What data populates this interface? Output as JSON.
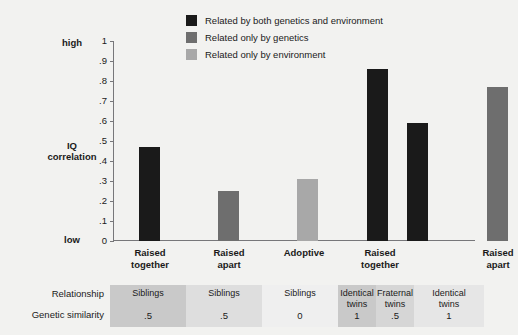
{
  "chart_data": {
    "type": "bar",
    "title": "",
    "xlabel": "",
    "ylabel": "IQ correlation",
    "ylim": [
      0,
      1
    ],
    "grid": false,
    "legend_position": "top-right",
    "categories": [
      "Raised\ntogether",
      "Raised\napart",
      "Adoptive",
      "Raised\ntogether",
      "",
      "Raised\napart"
    ],
    "bars": [
      {
        "label": "Raised together",
        "value": 0.47,
        "group": "both"
      },
      {
        "label": "Raised apart",
        "value": 0.25,
        "group": "genetics"
      },
      {
        "label": "Adoptive",
        "value": 0.31,
        "group": "environment"
      },
      {
        "label": "Raised together",
        "value": 0.86,
        "group": "both"
      },
      {
        "label": "Raised together",
        "value": 0.59,
        "group": "both"
      },
      {
        "label": "Raised apart",
        "value": 0.77,
        "group": "genetics"
      }
    ],
    "values": [
      0.47,
      0.25,
      0.31,
      0.86,
      0.59,
      0.77
    ],
    "yticks": [
      "0",
      ".1",
      ".2",
      ".3",
      ".4",
      ".5",
      ".6",
      ".7",
      ".8",
      ".9",
      "1"
    ],
    "ytick_values": [
      0,
      0.1,
      0.2,
      0.3,
      0.4,
      0.5,
      0.6,
      0.7,
      0.8,
      0.9,
      1
    ],
    "axis_high_label": "high",
    "axis_low_label": "low",
    "axis_title_line1": "IQ",
    "axis_title_line2": "correlation",
    "series": [
      {
        "name": "Related by both genetics and environment",
        "color": "#1a1a1a"
      },
      {
        "name": "Related only by genetics",
        "color": "#6e6e6e"
      },
      {
        "name": "Related only by environment",
        "color": "#a8a8a8"
      }
    ]
  },
  "legend": {
    "items": [
      {
        "label": "Related by both genetics and environment",
        "color": "#1a1a1a"
      },
      {
        "label": "Related only by genetics",
        "color": "#6e6e6e"
      },
      {
        "label": "Related only by environment",
        "color": "#a8a8a8"
      }
    ]
  },
  "categories": [
    {
      "line1": "Raised",
      "line2": "together"
    },
    {
      "line1": "Raised",
      "line2": "apart"
    },
    {
      "line1": "Adoptive",
      "line2": ""
    },
    {
      "line1": "Raised",
      "line2": "together"
    },
    {
      "line1": "Raised",
      "line2": "apart"
    }
  ],
  "table": {
    "row_headers": [
      "Relationship",
      "Genetic similarity"
    ],
    "cells": [
      {
        "relationship": "Siblings",
        "genetic_similarity": ".5",
        "shade": "#c9c9c9"
      },
      {
        "relationship": "Siblings",
        "genetic_similarity": ".5",
        "shade": "#dedede"
      },
      {
        "relationship": "Siblings",
        "genetic_similarity": "0",
        "shade": "#efefef"
      },
      {
        "relationship": "Identical\ntwins",
        "genetic_similarity": "1",
        "shade": "#c9c9c9"
      },
      {
        "relationship": "Fraternal\ntwins",
        "genetic_similarity": ".5",
        "shade": "#d6d6d6"
      },
      {
        "relationship": "Identical\ntwins",
        "genetic_similarity": "1",
        "shade": "#e6e6e6"
      }
    ]
  }
}
